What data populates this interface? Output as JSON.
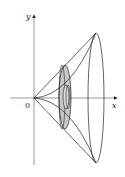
{
  "diagram": {
    "type": "solid-of-revolution",
    "labels": {
      "y_axis": "y",
      "x_axis": "x",
      "origin": "0"
    },
    "colors": {
      "stroke": "#222222",
      "washer_fill": "#c8c8c8",
      "background": "#ffffff"
    }
  }
}
